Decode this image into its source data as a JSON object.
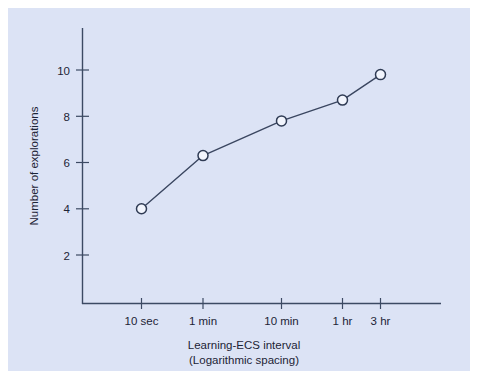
{
  "figure": {
    "background_color": "#ffffff",
    "panel_color": "#dce3f5",
    "line_color": "#3a4660",
    "axis_color": "#3c4a63",
    "marker_fill": "#f2f5fd"
  },
  "chart_data": {
    "type": "line",
    "title": "",
    "xlabel": "Learning-ECS interval",
    "xlabel_line2": "(Logarithmic spacing)",
    "ylabel": "Number of explorations",
    "categories": [
      "10 sec",
      "1 min",
      "10 min",
      "1 hr",
      "3 hr"
    ],
    "values": [
      4.0,
      6.3,
      7.8,
      8.7,
      9.8
    ],
    "series": [
      {
        "name": "Number of explorations",
        "values": [
          4.0,
          6.3,
          7.8,
          8.7,
          9.8
        ]
      }
    ],
    "ylim": [
      0,
      11.2
    ],
    "yticks": [
      2,
      4,
      6,
      8,
      10
    ],
    "ytick_labels": [
      "2",
      "4",
      "6",
      "8",
      "10"
    ],
    "xtick_labels": [
      "10 sec",
      "1 min",
      "10 min",
      "1 hr",
      "3 hr"
    ],
    "grid": false,
    "legend": false,
    "legend_position": "none",
    "marker": "open-circle",
    "x_spacing": "logarithmic",
    "annotations": []
  }
}
